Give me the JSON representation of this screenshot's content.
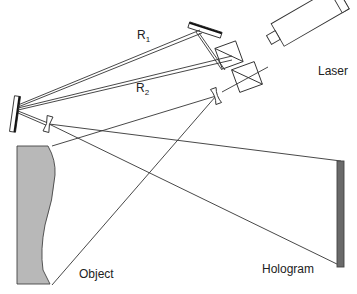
{
  "diagram": {
    "labels": {
      "r1_main": "R",
      "r1_sub": "1",
      "r2_main": "R",
      "r2_sub": "2",
      "laser": "Laser",
      "object": "Object",
      "hologram": "Hologram"
    },
    "components": [
      {
        "name": "laser",
        "type": "laser-source"
      },
      {
        "name": "beam-splitter-1",
        "type": "beam-splitter"
      },
      {
        "name": "beam-splitter-2",
        "type": "beam-splitter"
      },
      {
        "name": "mirror-top",
        "type": "mirror"
      },
      {
        "name": "mirror-left",
        "type": "mirror"
      },
      {
        "name": "lens-left",
        "type": "diverging-lens"
      },
      {
        "name": "lens-right",
        "type": "diverging-lens"
      },
      {
        "name": "object",
        "type": "object"
      },
      {
        "name": "hologram-plate",
        "type": "recording-plate"
      }
    ],
    "colors": {
      "line": "#333333",
      "object_fill": "#b8b8b8",
      "hologram_fill": "#6a6a6a",
      "mirror_fill": "#111111"
    }
  }
}
